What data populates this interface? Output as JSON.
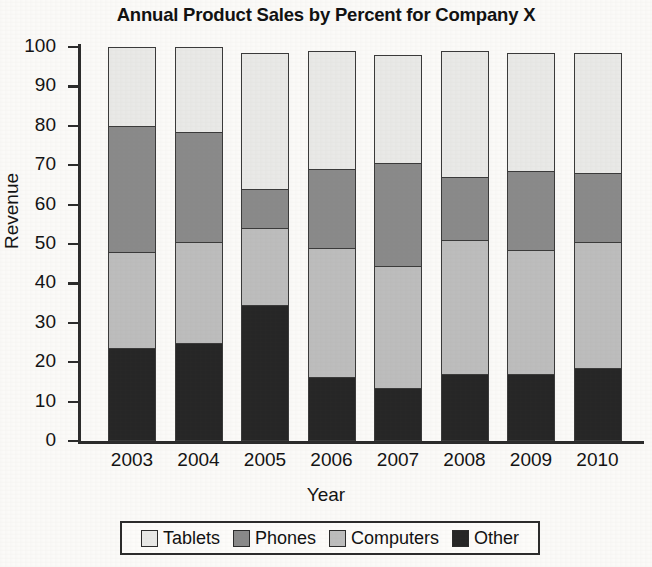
{
  "chart_data": {
    "type": "bar",
    "subtype": "stacked-percent",
    "title": "Annual Product Sales by Percent for Company X",
    "xlabel": "Year",
    "ylabel": "Revenue",
    "categories": [
      "2003",
      "2004",
      "2005",
      "2006",
      "2007",
      "2008",
      "2009",
      "2010"
    ],
    "ylim": [
      0,
      100
    ],
    "yticks": [
      "0",
      "10",
      "20",
      "30",
      "40",
      "50",
      "60",
      "70",
      "80",
      "90",
      "100"
    ],
    "grid": false,
    "legend_position": "bottom",
    "stack_order_bottom_to_top": [
      "Other",
      "Computers",
      "Phones",
      "Tablets"
    ],
    "series": [
      {
        "name": "Other",
        "color": "#262626",
        "values": [
          23.5,
          25,
          34.5,
          16.2,
          13.5,
          17,
          17,
          18.5
        ]
      },
      {
        "name": "Computers",
        "color": "#bdbdbd",
        "values": [
          24.5,
          25.5,
          19.5,
          32.8,
          31,
          34,
          31.5,
          32
        ]
      },
      {
        "name": "Phones",
        "color": "#8a8a8a",
        "values": [
          32,
          28,
          10,
          20,
          26,
          16,
          20,
          17.5
        ]
      },
      {
        "name": "Tablets",
        "color": "#e9e9e7",
        "values": [
          20,
          21.5,
          34.5,
          30,
          27.5,
          32,
          30,
          30.5
        ]
      }
    ],
    "cumulative_tops": {
      "2003": {
        "Other": 23.5,
        "Computers": 48,
        "Phones": 80,
        "Tablets": 100
      },
      "2004": {
        "Other": 25,
        "Computers": 50.5,
        "Phones": 78.5,
        "Tablets": 100
      },
      "2005": {
        "Other": 34.5,
        "Computers": 54,
        "Phones": 64,
        "Tablets": 98.5
      },
      "2006": {
        "Other": 16.2,
        "Computers": 49,
        "Phones": 69,
        "Tablets": 99
      },
      "2007": {
        "Other": 13.5,
        "Computers": 44.5,
        "Phones": 71,
        "Tablets": 98.5
      },
      "2008": {
        "Other": 17,
        "Computers": 51,
        "Phones": 67,
        "Tablets": 99
      },
      "2009": {
        "Other": 17,
        "Computers": 48.5,
        "Phones": 68.5,
        "Tablets": 98.5
      },
      "2010": {
        "Other": 18.5,
        "Computers": 50.5,
        "Phones": 68,
        "Tablets": 98.5
      }
    }
  },
  "legend": {
    "items": [
      {
        "label": "Tablets",
        "color": "#e9e9e7"
      },
      {
        "label": "Phones",
        "color": "#8a8a8a"
      },
      {
        "label": "Computers",
        "color": "#bdbdbd"
      },
      {
        "label": "Other",
        "color": "#262626"
      }
    ]
  }
}
